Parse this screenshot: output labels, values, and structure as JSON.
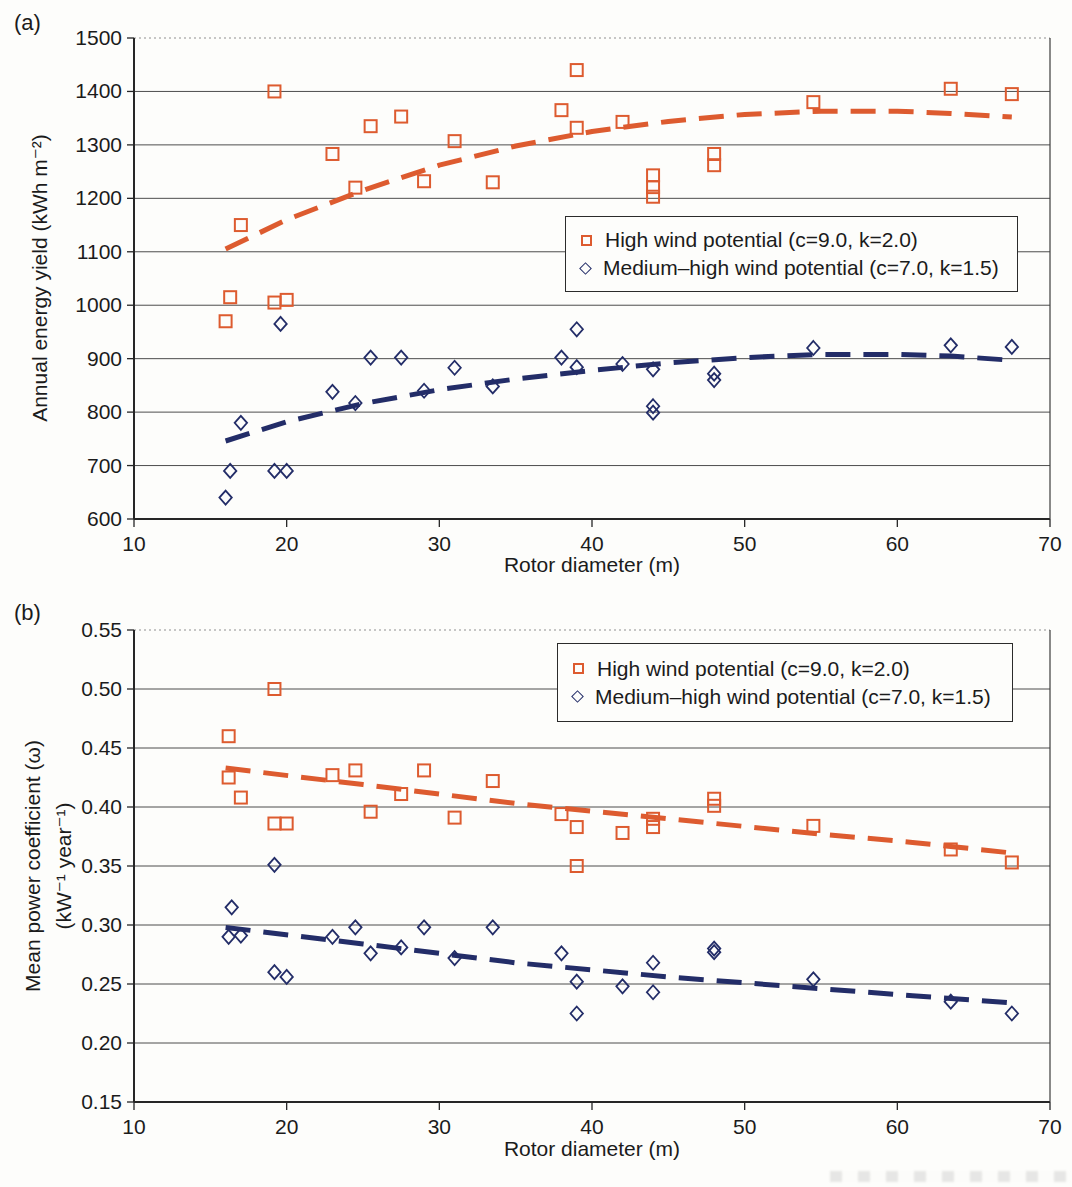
{
  "figure": {
    "colors": {
      "high_wind": "#dd5b2f",
      "medium_high_wind": "#232d68",
      "grid": "#4d4d4d",
      "axis": "#262626",
      "text": "#1b1b1b"
    }
  },
  "chart_data": [
    {
      "type": "scatter",
      "panel_label": "(a)",
      "xlabel": "Rotor diameter (m)",
      "ylabel": "Annual energy yield (kWh m⁻²)",
      "ylabel_lines": [
        "Annual energy yield (kWh m⁻²)"
      ],
      "xlim": [
        10,
        70
      ],
      "ylim": [
        600,
        1500
      ],
      "xticks": [
        10,
        20,
        30,
        40,
        50,
        60,
        70
      ],
      "xtick_labels": [
        "10",
        "20",
        "30",
        "40",
        "50",
        "60",
        "70"
      ],
      "yticks": [
        1500,
        1400,
        1300,
        1200,
        1100,
        1000,
        900,
        800,
        700,
        600
      ],
      "ytick_labels": [
        "1500",
        "1400",
        "1300",
        "1200",
        "1100",
        "1000",
        "900",
        "800",
        "700",
        "600"
      ],
      "grid": "horizontal",
      "legend_position": "right-middle",
      "series": [
        {
          "name": "High wind potential (c=9.0, k=2.0)",
          "marker": "square",
          "color": "#dd5b2f",
          "points": [
            [
              16,
              970
            ],
            [
              16.3,
              1015
            ],
            [
              17,
              1150
            ],
            [
              19.2,
              1005
            ],
            [
              19.2,
              1400
            ],
            [
              20,
              1010
            ],
            [
              23,
              1283
            ],
            [
              24.5,
              1220
            ],
            [
              25.5,
              1335
            ],
            [
              27.5,
              1353
            ],
            [
              29,
              1232
            ],
            [
              31,
              1307
            ],
            [
              33.5,
              1230
            ],
            [
              38,
              1365
            ],
            [
              39,
              1440
            ],
            [
              39,
              1332
            ],
            [
              42,
              1343
            ],
            [
              44,
              1243
            ],
            [
              44,
              1221
            ],
            [
              44,
              1203
            ],
            [
              48,
              1283
            ],
            [
              48,
              1262
            ],
            [
              54.5,
              1380
            ],
            [
              63.5,
              1405
            ],
            [
              67.5,
              1395
            ]
          ],
          "trend": [
            [
              16,
              1105
            ],
            [
              20,
              1160
            ],
            [
              25,
              1215
            ],
            [
              30,
              1262
            ],
            [
              35,
              1298
            ],
            [
              40,
              1325
            ],
            [
              45,
              1344
            ],
            [
              50,
              1357
            ],
            [
              55,
              1363
            ],
            [
              60,
              1363
            ],
            [
              63.5,
              1359
            ],
            [
              67.5,
              1352
            ]
          ]
        },
        {
          "name": "Medium–high wind potential (c=7.0, k=1.5)",
          "marker": "diamond",
          "color": "#232d68",
          "points": [
            [
              16,
              640
            ],
            [
              16.3,
              690
            ],
            [
              17,
              780
            ],
            [
              19.2,
              690
            ],
            [
              19.6,
              965
            ],
            [
              20,
              690
            ],
            [
              23,
              838
            ],
            [
              24.5,
              817
            ],
            [
              25.5,
              902
            ],
            [
              27.5,
              902
            ],
            [
              29,
              840
            ],
            [
              31,
              883
            ],
            [
              33.5,
              848
            ],
            [
              38,
              902
            ],
            [
              39,
              955
            ],
            [
              39,
              884
            ],
            [
              42,
              890
            ],
            [
              44,
              880
            ],
            [
              44,
              811
            ],
            [
              44,
              799
            ],
            [
              48,
              872
            ],
            [
              48,
              860
            ],
            [
              54.5,
              920
            ],
            [
              63.5,
              925
            ],
            [
              67.5,
              922
            ]
          ],
          "trend": [
            [
              16,
              746
            ],
            [
              20,
              782
            ],
            [
              25,
              816
            ],
            [
              30,
              842
            ],
            [
              35,
              862
            ],
            [
              40,
              878
            ],
            [
              45,
              892
            ],
            [
              50,
              902
            ],
            [
              55,
              908
            ],
            [
              60,
              908
            ],
            [
              63.5,
              905
            ],
            [
              67.5,
              897
            ]
          ]
        }
      ]
    },
    {
      "type": "scatter",
      "panel_label": "(b)",
      "xlabel": "Rotor diameter (m)",
      "ylabel": "Mean power coefficient (ω) (kW⁻¹ year⁻¹)",
      "ylabel_lines": [
        "Mean power coefficient (ω)",
        "(kW⁻¹ year⁻¹)"
      ],
      "xlim": [
        10,
        70
      ],
      "ylim": [
        0.15,
        0.55
      ],
      "xticks": [
        10,
        20,
        30,
        40,
        50,
        60,
        70
      ],
      "xtick_labels": [
        "10",
        "20",
        "30",
        "40",
        "50",
        "60",
        "70"
      ],
      "yticks": [
        0.55,
        0.5,
        0.45,
        0.4,
        0.35,
        0.3,
        0.25,
        0.2,
        0.15
      ],
      "ytick_labels": [
        "0.55",
        "0.50",
        "0.45",
        "0.40",
        "0.35",
        "0.30",
        "0.25",
        "0.20",
        "0.15"
      ],
      "grid": "horizontal",
      "legend_position": "top-right",
      "series": [
        {
          "name": "High wind potential (c=9.0, k=2.0)",
          "marker": "square",
          "color": "#dd5b2f",
          "points": [
            [
              16.2,
              0.46
            ],
            [
              16.2,
              0.425
            ],
            [
              17,
              0.408
            ],
            [
              19.2,
              0.5
            ],
            [
              19.2,
              0.386
            ],
            [
              20,
              0.386
            ],
            [
              23,
              0.427
            ],
            [
              24.5,
              0.431
            ],
            [
              25.5,
              0.396
            ],
            [
              27.5,
              0.411
            ],
            [
              29,
              0.431
            ],
            [
              31,
              0.391
            ],
            [
              33.5,
              0.422
            ],
            [
              38,
              0.394
            ],
            [
              39,
              0.383
            ],
            [
              39,
              0.35
            ],
            [
              42,
              0.378
            ],
            [
              44,
              0.39
            ],
            [
              44,
              0.383
            ],
            [
              48,
              0.407
            ],
            [
              48,
              0.401
            ],
            [
              54.5,
              0.384
            ],
            [
              63.5,
              0.364
            ],
            [
              67.5,
              0.353
            ]
          ],
          "trend": [
            [
              16,
              0.433
            ],
            [
              25,
              0.419
            ],
            [
              35,
              0.403
            ],
            [
              45,
              0.39
            ],
            [
              55,
              0.377
            ],
            [
              61,
              0.37
            ],
            [
              67.5,
              0.361
            ]
          ]
        },
        {
          "name": "Medium–high wind potential (c=7.0, k=1.5)",
          "marker": "diamond",
          "color": "#232d68",
          "points": [
            [
              16.4,
              0.315
            ],
            [
              16.2,
              0.29
            ],
            [
              17,
              0.291
            ],
            [
              19.2,
              0.351
            ],
            [
              19.2,
              0.26
            ],
            [
              20,
              0.256
            ],
            [
              23,
              0.29
            ],
            [
              24.5,
              0.298
            ],
            [
              25.5,
              0.276
            ],
            [
              27.5,
              0.281
            ],
            [
              29,
              0.298
            ],
            [
              31,
              0.272
            ],
            [
              33.5,
              0.298
            ],
            [
              38,
              0.276
            ],
            [
              39,
              0.252
            ],
            [
              39,
              0.225
            ],
            [
              42,
              0.248
            ],
            [
              44,
              0.268
            ],
            [
              44,
              0.243
            ],
            [
              48,
              0.277
            ],
            [
              48,
              0.28
            ],
            [
              54.5,
              0.254
            ],
            [
              63.5,
              0.235
            ],
            [
              67.5,
              0.225
            ]
          ],
          "trend": [
            [
              16,
              0.298
            ],
            [
              25,
              0.284
            ],
            [
              35,
              0.268
            ],
            [
              45,
              0.256
            ],
            [
              55,
              0.246
            ],
            [
              61,
              0.24
            ],
            [
              67.5,
              0.234
            ]
          ]
        }
      ]
    }
  ]
}
